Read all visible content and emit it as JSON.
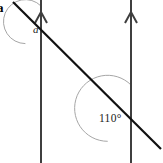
{
  "figure": {
    "kind": "geometry-diagram",
    "topic": "parallel-lines-transversal",
    "width": 163,
    "height": 163,
    "background_color": "#ffffff"
  },
  "question_number": {
    "text": "a",
    "clipped": true
  },
  "labels": {
    "angle_a": "a",
    "angle_known": "110°"
  },
  "colors": {
    "parallel_line": "#3f3f3f",
    "transversal_line": "#111111",
    "arc": "#a0a0a0",
    "label_text": "#1a1a1a",
    "background": "#ffffff"
  },
  "geometry": {
    "parallel_lines": [
      {
        "name": "left-parallel-line",
        "x": 41,
        "y_top": 0,
        "y_bottom": 163,
        "arrow_marker": {
          "direction": "up",
          "tip_x": 41,
          "tip_y": 12,
          "half_width": 6,
          "height": 11
        }
      },
      {
        "name": "right-parallel-line",
        "x": 131,
        "y_top": 0,
        "y_bottom": 163,
        "arrow_marker": {
          "direction": "up",
          "tip_x": 131,
          "tip_y": 12,
          "half_width": 6,
          "height": 11
        }
      }
    ],
    "transversal": {
      "name": "transversal-line",
      "x1": 13,
      "y1": 2,
      "x2": 161,
      "y2": 149
    },
    "intersections": [
      {
        "name": "upper-intersection",
        "x": 41,
        "y": 28
      },
      {
        "name": "lower-intersection",
        "x": 131,
        "y": 118
      }
    ],
    "arcs": [
      {
        "name": "angle-a-arc",
        "center_x": 41,
        "center_y": 28,
        "radius": 22,
        "start_deg": 225,
        "end_deg": 90,
        "sweep": "counterclockwise"
      },
      {
        "name": "angle-110-arc",
        "center_x": 131,
        "center_y": 118,
        "radius": 33,
        "start_deg": 225,
        "end_deg": 90,
        "sweep": "counterclockwise"
      }
    ]
  }
}
